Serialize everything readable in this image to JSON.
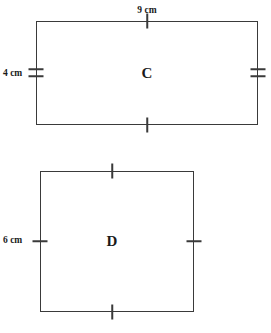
{
  "figure": {
    "type": "geometry-diagram",
    "stroke_color": "#3a3a3a",
    "text_color": "#1a1a1a",
    "background_color": "#ffffff"
  },
  "shapes": [
    {
      "id": "C",
      "name": "rectangle-c",
      "letter": "C",
      "kind": "rectangle",
      "labels": {
        "top": "9 cm",
        "left": "4 cm"
      },
      "dimensions": {
        "width_cm": 9,
        "height_cm": 4
      },
      "tick_marks": {
        "top": 1,
        "bottom": 1,
        "left": 2,
        "right": 2
      }
    },
    {
      "id": "D",
      "name": "square-d",
      "letter": "D",
      "kind": "square",
      "labels": {
        "left": "6 cm"
      },
      "dimensions": {
        "width_cm": 6,
        "height_cm": 6
      },
      "tick_marks": {
        "top": 1,
        "bottom": 1,
        "left": 1,
        "right": 1
      }
    }
  ]
}
